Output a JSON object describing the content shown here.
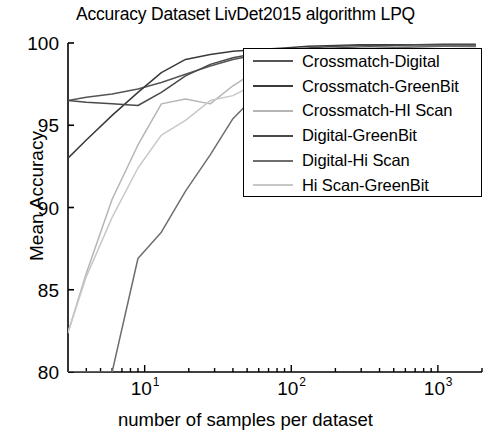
{
  "chart_data": {
    "type": "line",
    "title": "Accuracy Dataset LivDet2015 algorithm LPQ",
    "xlabel": "number of samples per dataset",
    "ylabel": "Mean Accuracy",
    "xscale": "log",
    "xlim": [
      3,
      2000
    ],
    "ylim": [
      80,
      100
    ],
    "grid": false,
    "legend_position": "upper-right-inside",
    "yticks": [
      "80",
      "85",
      "90",
      "95",
      "100"
    ],
    "ytick_values": [
      80,
      85,
      90,
      95,
      100
    ],
    "xticks": [
      "10",
      "10",
      "10"
    ],
    "xtick_exponents": [
      "1",
      "2",
      "3"
    ],
    "xtick_values": [
      10,
      100,
      1000
    ],
    "series": [
      {
        "name": "Crossmatch-Digital",
        "color": "#555555",
        "x": [
          3,
          4,
          6,
          9,
          13,
          19,
          28,
          40,
          60,
          90,
          130,
          200,
          300,
          450,
          700,
          1100,
          1800
        ],
        "y": [
          96.5,
          96.7,
          96.9,
          97.2,
          97.6,
          98.1,
          98.6,
          99.0,
          99.3,
          99.5,
          99.6,
          99.7,
          99.75,
          99.8,
          99.8,
          99.85,
          99.85
        ]
      },
      {
        "name": "Crossmatch-GreenBit",
        "color": "#3a3a3a",
        "x": [
          3,
          4,
          6,
          9,
          13,
          19,
          28,
          40,
          60,
          90,
          130,
          200,
          300,
          450,
          700,
          1100,
          1800
        ],
        "y": [
          93.0,
          94.1,
          95.6,
          97.0,
          98.2,
          99.0,
          99.3,
          99.5,
          99.6,
          99.7,
          99.8,
          99.85,
          99.9,
          99.9,
          99.9,
          99.92,
          99.92
        ]
      },
      {
        "name": "Crossmatch-HI Scan",
        "color": "#b5b5b5",
        "x": [
          3,
          4,
          6,
          9,
          13,
          19,
          28,
          40,
          60,
          90,
          130,
          200,
          300,
          450,
          700,
          1100,
          1800
        ],
        "y": [
          82.4,
          86.0,
          90.5,
          93.8,
          96.3,
          96.6,
          96.3,
          97.4,
          98.4,
          99.1,
          99.4,
          99.6,
          99.7,
          99.75,
          99.8,
          99.8,
          99.8
        ]
      },
      {
        "name": "Digital-GreenBit",
        "color": "#4a4a4a",
        "x": [
          3,
          4,
          6,
          9,
          13,
          19,
          28,
          40,
          60,
          90,
          130,
          200,
          300,
          450,
          700,
          1100,
          1800
        ],
        "y": [
          96.5,
          96.4,
          96.3,
          96.2,
          97.0,
          98.0,
          98.7,
          99.1,
          99.4,
          99.6,
          99.7,
          99.8,
          99.85,
          99.85,
          99.9,
          99.9,
          99.9
        ]
      },
      {
        "name": "Digital-Hi Scan",
        "color": "#6e6e6e",
        "x": [
          3,
          4,
          6,
          9,
          13,
          19,
          28,
          40,
          60,
          90,
          130,
          200,
          300,
          450,
          700,
          1100,
          1800
        ],
        "y": [
          80.0,
          80.0,
          80.0,
          86.9,
          88.5,
          91.0,
          93.2,
          95.4,
          97.0,
          98.3,
          99.0,
          99.4,
          99.6,
          99.7,
          99.75,
          99.8,
          99.8
        ]
      },
      {
        "name": "Hi Scan-GreenBit",
        "color": "#c8c8c8",
        "x": [
          3,
          4,
          6,
          9,
          13,
          19,
          28,
          40,
          60,
          90,
          130,
          200,
          300,
          450,
          700,
          1100,
          1800
        ],
        "y": [
          82.4,
          85.8,
          89.4,
          92.4,
          94.4,
          95.3,
          96.5,
          96.8,
          97.6,
          98.3,
          98.8,
          99.2,
          99.4,
          99.5,
          99.6,
          99.65,
          99.7
        ]
      }
    ]
  },
  "axes": {
    "ylabel": "Mean Accuracy",
    "xlabel": "number of samples per dataset"
  },
  "legend": {
    "items": [
      {
        "label": "Crossmatch-Digital"
      },
      {
        "label": "Crossmatch-GreenBit"
      },
      {
        "label": "Crossmatch-HI Scan"
      },
      {
        "label": "Digital-GreenBit"
      },
      {
        "label": "Digital-Hi Scan"
      },
      {
        "label": "Hi Scan-GreenBit"
      }
    ]
  }
}
